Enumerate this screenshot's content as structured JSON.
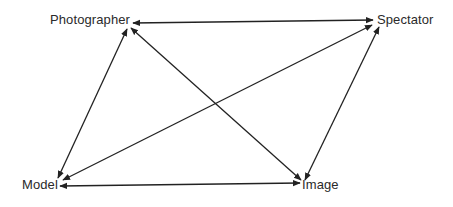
{
  "diagram": {
    "type": "relationship-diagram",
    "nodes": {
      "photographer": {
        "label": "Photographer"
      },
      "spectator": {
        "label": "Spectator"
      },
      "model": {
        "label": "Model"
      },
      "image": {
        "label": "Image"
      }
    },
    "edges": [
      {
        "from": "Photographer",
        "to": "Spectator",
        "direction": "bidirectional"
      },
      {
        "from": "Photographer",
        "to": "Model",
        "direction": "bidirectional"
      },
      {
        "from": "Photographer",
        "to": "Image",
        "direction": "bidirectional"
      },
      {
        "from": "Spectator",
        "to": "Model",
        "direction": "bidirectional"
      },
      {
        "from": "Spectator",
        "to": "Image",
        "direction": "bidirectional"
      },
      {
        "from": "Model",
        "to": "Image",
        "direction": "bidirectional"
      }
    ],
    "colors": {
      "line": "#222222",
      "text": "#2a2a2a",
      "background": "#ffffff"
    }
  }
}
